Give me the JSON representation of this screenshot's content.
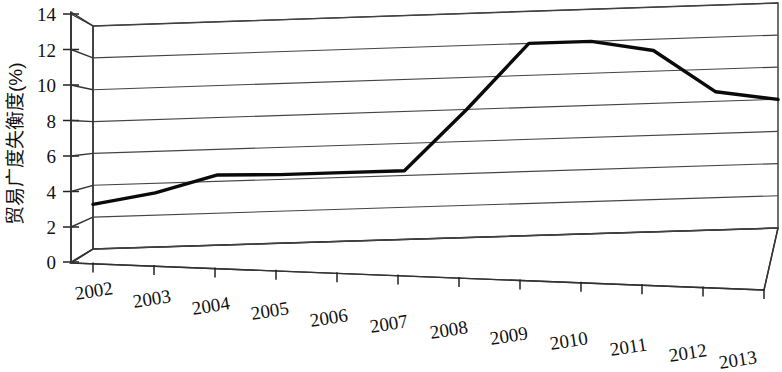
{
  "chart_data": {
    "type": "line",
    "title": "",
    "subtitle": "",
    "xlabel": "",
    "ylabel": "贸易广度失衡度(%)",
    "categories": [
      "2002",
      "2003",
      "2004",
      "2005",
      "2006",
      "2007",
      "2008",
      "2009",
      "2010",
      "2011",
      "2012",
      "2013"
    ],
    "values": [
      2.8,
      3.4,
      4.4,
      4.3,
      4.3,
      4.3,
      8.0,
      12.0,
      12.0,
      11.3,
      8.6,
      8.0
    ],
    "series": [
      {
        "name": "贸易广度失衡度",
        "values": [
          2.8,
          3.4,
          4.4,
          4.3,
          4.3,
          4.3,
          8.0,
          12.0,
          12.0,
          11.3,
          8.6,
          8.0
        ],
        "color": "#0a0a0a"
      }
    ],
    "ylim": [
      0,
      14
    ],
    "yticks": [
      0,
      2,
      4,
      6,
      8,
      10,
      12,
      14
    ],
    "ytick_labels": [
      "0",
      "2",
      "4",
      "6",
      "8",
      "10",
      "12",
      "14"
    ],
    "grid": true,
    "grid_axis": "y",
    "legend": false,
    "legend_position": "none",
    "style": "3d-perspective",
    "line_color": "#0a0a0a",
    "grid_color": "#444444",
    "background_color": "#ffffff",
    "xtick_rotation": -9,
    "annotations": []
  },
  "axes": {
    "y_label_text": "贸易广度失衡度(%)",
    "y_tick_labels": [
      "14",
      "12",
      "10",
      "8",
      "6",
      "4",
      "2",
      "0"
    ],
    "x_tick_labels": [
      "2002",
      "2003",
      "2004",
      "2005",
      "2006",
      "2007",
      "2008",
      "2009",
      "2010",
      "2011",
      "2012",
      "2013"
    ]
  }
}
